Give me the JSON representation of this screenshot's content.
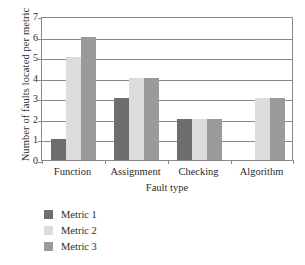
{
  "chart_data": {
    "type": "bar",
    "title": "",
    "subtitle": "",
    "xlabel": "Fault type",
    "ylabel": "Number of faults located per metric",
    "categories": [
      "Function",
      "Assignment",
      "Checking",
      "Algorithm"
    ],
    "series": [
      {
        "name": "Metric 1",
        "color": "#6e6e6e",
        "values": [
          1,
          3,
          2,
          0
        ]
      },
      {
        "name": "Metric 2",
        "color": "#dcdcdc",
        "values": [
          5,
          4,
          2,
          3
        ]
      },
      {
        "name": "Metric 3",
        "color": "#9a9a9a",
        "values": [
          6,
          4,
          2,
          3
        ]
      }
    ],
    "ylim": [
      0,
      7
    ],
    "yticks": [
      0,
      1,
      2,
      3,
      4,
      5,
      6,
      7
    ],
    "ytick_labels": [
      "0",
      "1",
      "2",
      "3",
      "4",
      "5",
      "6",
      "7"
    ],
    "grid": "horizontal",
    "legend_position": "below-left",
    "bar_group_order": [
      "Metric 1",
      "Metric 2",
      "Metric 3"
    ]
  },
  "axes": {
    "y_title": "Number of faults located per metric",
    "x_title": "Fault type"
  },
  "legend": {
    "entries": [
      {
        "label": "Metric 1",
        "color": "#6e6e6e"
      },
      {
        "label": "Metric 2",
        "color": "#dcdcdc"
      },
      {
        "label": "Metric 3",
        "color": "#9a9a9a"
      }
    ]
  },
  "style": {
    "frame_color": "#8a8a8a",
    "background": "#ffffff",
    "text_color": "#2b2b2b"
  }
}
